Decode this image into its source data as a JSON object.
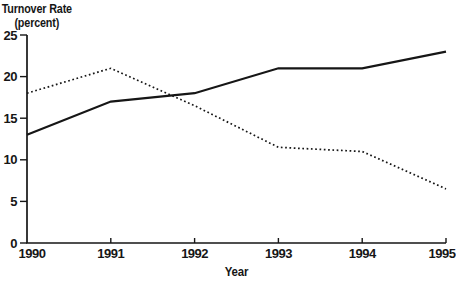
{
  "chart_data": {
    "type": "line",
    "title": "",
    "ylabel_line1": "Turnover Rate",
    "ylabel_line2": "(percent)",
    "xlabel": "Year",
    "x": [
      1990,
      1991,
      1992,
      1993,
      1994,
      1995
    ],
    "series": [
      {
        "name": "solid-series",
        "line_style": "solid",
        "color": "#161616",
        "values": [
          13,
          17,
          18,
          21,
          21,
          23
        ]
      },
      {
        "name": "dotted-series",
        "line_style": "dotted",
        "color": "#161616",
        "values": [
          18,
          21,
          16.5,
          11.5,
          11,
          6.5
        ]
      }
    ],
    "yticks": [
      0,
      5,
      10,
      15,
      20,
      25
    ],
    "ylim": [
      0,
      25
    ],
    "grid": false,
    "legend": "none",
    "background": "#ffffff",
    "axis_color": "#161616"
  }
}
